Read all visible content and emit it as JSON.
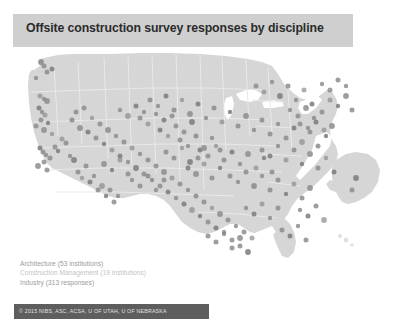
{
  "slide": {
    "title": "Offsite construction survey responses by discipline",
    "background_color": "#ffffff",
    "title_band_color": "#cfcfcf",
    "title_text_color": "#2b2b2b"
  },
  "legend": {
    "items": [
      {
        "label": "Architecture (53 institutions)",
        "color": "#9a9a9a"
      },
      {
        "label": "Construction Management (19 institutions)",
        "color": "#c3c3c3"
      },
      {
        "label": "Industry (313 responses)",
        "color": "#9a9a9a"
      }
    ]
  },
  "footer": {
    "attribution": "© 2015 NIBS, ASC, ACSA, U OF UTAH, U OF NEBRASKA",
    "bar_color": "#5e5e5e",
    "text_color": "#e2e2e2"
  },
  "map": {
    "icon_name": "united-states-map",
    "land_color": "#d6d6d6",
    "state_border_color": "#e8e8e8",
    "water_color": "#ffffff",
    "dot_color": "#8d8d8d",
    "dot_color_dark": "#7b7b7b",
    "insets": [
      "alaska",
      "hawaii"
    ]
  },
  "chart_data": {
    "type": "scatter",
    "title": "Offsite construction survey responses by discipline",
    "xlabel": "",
    "ylabel": "",
    "projection": "usa-albers",
    "grid": false,
    "legend_position": "bottom-left",
    "series": [
      {
        "name": "Architecture (53 institutions)",
        "count": 53,
        "unit": "institutions",
        "color": "#9a9a9a"
      },
      {
        "name": "Construction Management (19 institutions)",
        "count": 19,
        "unit": "institutions",
        "color": "#c3c3c3"
      },
      {
        "name": "Industry (313 responses)",
        "count": 313,
        "unit": "responses",
        "color": "#9a9a9a"
      }
    ],
    "total_responses": 385,
    "points": [
      [
        41,
        62
      ],
      [
        44,
        66
      ],
      [
        47,
        72
      ],
      [
        36,
        78
      ],
      [
        52,
        69
      ],
      [
        40,
        96
      ],
      [
        44,
        99
      ],
      [
        47,
        101
      ],
      [
        39,
        108
      ],
      [
        42,
        112
      ],
      [
        45,
        115
      ],
      [
        41,
        120
      ],
      [
        48,
        123
      ],
      [
        36,
        126
      ],
      [
        44,
        130
      ],
      [
        52,
        134
      ],
      [
        40,
        148
      ],
      [
        43,
        152
      ],
      [
        46,
        155
      ],
      [
        50,
        158
      ],
      [
        44,
        162
      ],
      [
        38,
        166
      ],
      [
        47,
        170
      ],
      [
        55,
        147
      ],
      [
        58,
        151
      ],
      [
        62,
        139
      ],
      [
        66,
        143
      ],
      [
        70,
        156
      ],
      [
        74,
        160
      ],
      [
        78,
        172
      ],
      [
        82,
        178
      ],
      [
        86,
        166
      ],
      [
        90,
        182
      ],
      [
        94,
        176
      ],
      [
        98,
        190
      ],
      [
        102,
        186
      ],
      [
        106,
        196
      ],
      [
        110,
        190
      ],
      [
        114,
        202
      ],
      [
        118,
        196
      ],
      [
        72,
        120
      ],
      [
        76,
        112
      ],
      [
        80,
        128
      ],
      [
        84,
        108
      ],
      [
        88,
        132
      ],
      [
        92,
        118
      ],
      [
        96,
        138
      ],
      [
        100,
        124
      ],
      [
        104,
        144
      ],
      [
        108,
        130
      ],
      [
        112,
        150
      ],
      [
        116,
        136
      ],
      [
        120,
        156
      ],
      [
        124,
        142
      ],
      [
        128,
        162
      ],
      [
        132,
        148
      ],
      [
        136,
        168
      ],
      [
        140,
        154
      ],
      [
        144,
        174
      ],
      [
        148,
        160
      ],
      [
        152,
        180
      ],
      [
        156,
        166
      ],
      [
        160,
        186
      ],
      [
        164,
        172
      ],
      [
        168,
        192
      ],
      [
        172,
        178
      ],
      [
        176,
        198
      ],
      [
        180,
        184
      ],
      [
        184,
        204
      ],
      [
        188,
        190
      ],
      [
        192,
        210
      ],
      [
        196,
        196
      ],
      [
        200,
        216
      ],
      [
        204,
        202
      ],
      [
        208,
        222
      ],
      [
        212,
        208
      ],
      [
        216,
        228
      ],
      [
        220,
        214
      ],
      [
        224,
        234
      ],
      [
        228,
        220
      ],
      [
        232,
        240
      ],
      [
        236,
        226
      ],
      [
        240,
        246
      ],
      [
        244,
        232
      ],
      [
        248,
        252
      ],
      [
        252,
        238
      ],
      [
        150,
        100
      ],
      [
        158,
        106
      ],
      [
        166,
        96
      ],
      [
        174,
        110
      ],
      [
        182,
        100
      ],
      [
        190,
        114
      ],
      [
        198,
        104
      ],
      [
        206,
        118
      ],
      [
        214,
        108
      ],
      [
        222,
        122
      ],
      [
        230,
        112
      ],
      [
        238,
        126
      ],
      [
        246,
        116
      ],
      [
        254,
        130
      ],
      [
        262,
        120
      ],
      [
        270,
        134
      ],
      [
        278,
        124
      ],
      [
        286,
        138
      ],
      [
        294,
        128
      ],
      [
        302,
        142
      ],
      [
        310,
        132
      ],
      [
        318,
        146
      ],
      [
        326,
        136
      ],
      [
        256,
        86
      ],
      [
        264,
        92
      ],
      [
        272,
        82
      ],
      [
        280,
        96
      ],
      [
        288,
        86
      ],
      [
        296,
        100
      ],
      [
        304,
        90
      ],
      [
        312,
        104
      ],
      [
        290,
        110
      ],
      [
        298,
        116
      ],
      [
        306,
        108
      ],
      [
        314,
        118
      ],
      [
        322,
        112
      ],
      [
        300,
        124
      ],
      [
        308,
        128
      ],
      [
        316,
        122
      ],
      [
        324,
        130
      ],
      [
        332,
        126
      ],
      [
        262,
        150
      ],
      [
        270,
        156
      ],
      [
        278,
        146
      ],
      [
        286,
        160
      ],
      [
        294,
        150
      ],
      [
        302,
        164
      ],
      [
        310,
        154
      ],
      [
        318,
        168
      ],
      [
        326,
        158
      ],
      [
        334,
        172
      ],
      [
        230,
        176
      ],
      [
        238,
        182
      ],
      [
        246,
        172
      ],
      [
        254,
        186
      ],
      [
        262,
        176
      ],
      [
        270,
        190
      ],
      [
        278,
        180
      ],
      [
        286,
        194
      ],
      [
        294,
        184
      ],
      [
        302,
        198
      ],
      [
        310,
        188
      ],
      [
        200,
        150
      ],
      [
        208,
        156
      ],
      [
        216,
        146
      ],
      [
        224,
        160
      ],
      [
        232,
        152
      ],
      [
        240,
        164
      ],
      [
        248,
        154
      ],
      [
        256,
        168
      ],
      [
        264,
        158
      ],
      [
        272,
        172
      ],
      [
        180,
        140
      ],
      [
        188,
        146
      ],
      [
        196,
        136
      ],
      [
        204,
        148
      ],
      [
        212,
        138
      ],
      [
        220,
        150
      ],
      [
        160,
        130
      ],
      [
        168,
        136
      ],
      [
        176,
        126
      ],
      [
        184,
        132
      ],
      [
        192,
        122
      ],
      [
        140,
        118
      ],
      [
        148,
        124
      ],
      [
        156,
        114
      ],
      [
        164,
        120
      ],
      [
        172,
        116
      ],
      [
        120,
        110
      ],
      [
        128,
        116
      ],
      [
        136,
        106
      ],
      [
        144,
        112
      ],
      [
        208,
        236
      ],
      [
        216,
        242
      ],
      [
        224,
        232
      ],
      [
        232,
        248
      ],
      [
        240,
        238
      ],
      [
        246,
        208
      ],
      [
        254,
        214
      ],
      [
        262,
        204
      ],
      [
        270,
        218
      ],
      [
        278,
        208
      ],
      [
        188,
        168
      ],
      [
        196,
        174
      ],
      [
        204,
        164
      ],
      [
        212,
        178
      ],
      [
        220,
        168
      ],
      [
        166,
        152
      ],
      [
        174,
        158
      ],
      [
        182,
        148
      ],
      [
        190,
        162
      ],
      [
        198,
        158
      ],
      [
        132,
        180
      ],
      [
        140,
        186
      ],
      [
        148,
        176
      ],
      [
        156,
        190
      ],
      [
        164,
        180
      ],
      [
        104,
        164
      ],
      [
        112,
        170
      ],
      [
        120,
        160
      ],
      [
        128,
        174
      ],
      [
        300,
        210
      ],
      [
        308,
        216
      ],
      [
        316,
        206
      ],
      [
        324,
        220
      ],
      [
        282,
        230
      ],
      [
        290,
        236
      ],
      [
        298,
        226
      ],
      [
        306,
        240
      ],
      [
        330,
        100
      ],
      [
        338,
        106
      ],
      [
        346,
        96
      ],
      [
        352,
        110
      ],
      [
        322,
        84
      ],
      [
        330,
        90
      ],
      [
        338,
        80
      ],
      [
        346,
        86
      ],
      [
        352,
        190
      ],
      [
        356,
        178
      ]
    ]
  }
}
